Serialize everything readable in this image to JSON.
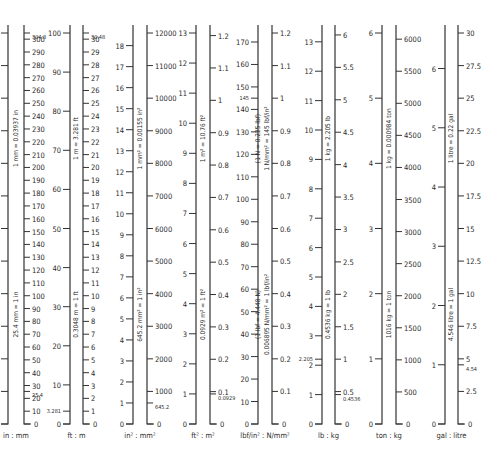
{
  "chart_data": {
    "type": "conversion-scales",
    "baseline_y": 424,
    "top_y": 33,
    "scales": [
      {
        "id": "in-mm",
        "caption": "in : mm",
        "left": {
          "unit": "in",
          "x": 8,
          "max": 12,
          "ticks": [
            0,
            1,
            2,
            3,
            4,
            5,
            6,
            7,
            8,
            9,
            10,
            11,
            12
          ],
          "labels_visible": false,
          "extra": []
        },
        "right": {
          "unit": "mm",
          "x": 24,
          "max": 304.8,
          "ticks": [
            0,
            10,
            20,
            30,
            40,
            50,
            60,
            70,
            80,
            90,
            100,
            110,
            120,
            130,
            140,
            150,
            160,
            170,
            180,
            190,
            200,
            210,
            220,
            230,
            240,
            250,
            260,
            270,
            280,
            290,
            300
          ],
          "extra": [
            {
              "v": 304.8,
              "label": "304.8"
            },
            {
              "v": 25.4,
              "label": "25.4"
            }
          ]
        },
        "annotations": [
          "1 mm = 0.03937 in",
          "25.4 mm = 1 in"
        ]
      },
      {
        "id": "ft-m",
        "caption": "ft : m",
        "left": {
          "unit": "ft",
          "x": 70,
          "max": 100,
          "ticks": [
            0,
            10,
            20,
            30,
            40,
            50,
            60,
            70,
            80,
            90,
            100
          ],
          "extra": [
            {
              "v": 3.281,
              "label": "3.281"
            }
          ]
        },
        "right": {
          "unit": "m",
          "x": 83,
          "max": 30.48,
          "ticks": [
            0,
            1,
            2,
            3,
            4,
            5,
            6,
            7,
            8,
            9,
            10,
            11,
            12,
            13,
            14,
            15,
            16,
            17,
            18,
            19,
            20,
            21,
            22,
            23,
            24,
            25,
            26,
            27,
            28,
            29,
            30
          ],
          "extra": [
            {
              "v": 30.48,
              "label": "30.48"
            }
          ]
        },
        "annotations": [
          "1 m = 3.281 ft",
          "0.3048 m = 1 ft"
        ]
      },
      {
        "id": "in2-mm2",
        "caption": "in² : mm²",
        "left": {
          "unit": "in²",
          "x": 133,
          "max": 18.6,
          "ticks": [
            0,
            1,
            2,
            3,
            4,
            5,
            6,
            7,
            8,
            9,
            10,
            11,
            12,
            13,
            14,
            15,
            16,
            17,
            18
          ],
          "extra": []
        },
        "right": {
          "unit": "mm²",
          "x": 147,
          "max": 12000,
          "ticks": [
            0,
            1000,
            2000,
            3000,
            4000,
            5000,
            6000,
            7000,
            8000,
            9000,
            10000,
            11000,
            12000
          ],
          "extra": [
            {
              "v": 645.2,
              "label": "645.2"
            }
          ]
        },
        "annotations": [
          "1 mm² = 0.00155 in²",
          "645.2 mm² = 1 in²"
        ]
      },
      {
        "id": "ft2-m2",
        "caption": "ft² : m²",
        "left": {
          "unit": "ft²",
          "x": 196,
          "max": 13.0,
          "ticks": [
            0,
            1,
            2,
            3,
            4,
            5,
            6,
            7,
            8,
            9,
            10,
            11,
            12,
            13
          ],
          "extra": []
        },
        "right": {
          "unit": "m²",
          "x": 210,
          "max": 1.208,
          "ticks": [
            0,
            0.1,
            0.2,
            0.3,
            0.4,
            0.5,
            0.6,
            0.7,
            0.8,
            0.9,
            1.0,
            1.1,
            1.2
          ],
          "extra": [
            {
              "v": 0.0929,
              "label": "0.0929"
            }
          ]
        },
        "annotations": [
          "1 m² = 10.76 ft²",
          "0.0929 m² = 1 ft²"
        ]
      },
      {
        "id": "lbf-in2-n-mm2",
        "caption": "lbf/in² : N/mm²",
        "left": {
          "unit": "lbf/in²",
          "x": 258,
          "max": 174,
          "ticks": [
            0,
            10,
            20,
            30,
            40,
            50,
            60,
            70,
            80,
            90,
            100,
            110,
            120,
            130,
            140,
            150,
            160,
            170
          ],
          "extra": [
            {
              "v": 145,
              "label": "145"
            }
          ]
        },
        "right": {
          "unit": "N/mm²",
          "x": 272,
          "max": 1.2,
          "ticks": [
            0,
            0.1,
            0.2,
            0.3,
            0.4,
            0.5,
            0.6,
            0.7,
            0.8,
            0.9,
            1.0,
            1.1,
            1.2
          ],
          "extra": []
        },
        "annotations": [
          "(1 N = 0.225 lbf)",
          "1 N/mm² = 145 lbf/in²",
          "(1 lbf = 4.448 N)",
          "0.006895 N/mm² = 1 lbf/in²"
        ]
      },
      {
        "id": "lb-kg",
        "caption": "lb : kg",
        "left": {
          "unit": "lb",
          "x": 322,
          "max": 13.3,
          "ticks": [
            0,
            1,
            2,
            3,
            4,
            5,
            6,
            7,
            8,
            9,
            10,
            11,
            12,
            13
          ],
          "extra": [
            {
              "v": 2.205,
              "label": "2.205"
            }
          ]
        },
        "right": {
          "unit": "kg",
          "x": 335,
          "max": 6.03,
          "ticks": [
            0,
            0.5,
            1.0,
            1.5,
            2.0,
            2.5,
            3.0,
            3.5,
            4.0,
            4.5,
            5.0,
            5.5,
            6.0
          ],
          "extra": [
            {
              "v": 0.4536,
              "label": "0.4536"
            }
          ]
        },
        "annotations": [
          "1 kg = 2.205 lb",
          "0.4536 kg = 1 lb"
        ]
      },
      {
        "id": "ton-kg",
        "caption": "ton : kg",
        "left": {
          "unit": "ton",
          "x": 382,
          "max": 6.0,
          "ticks": [
            0,
            1,
            2,
            3,
            4,
            5,
            6
          ],
          "extra": []
        },
        "right": {
          "unit": "kg",
          "x": 396,
          "max": 6096,
          "ticks": [
            0,
            500,
            1000,
            1500,
            2000,
            2500,
            3000,
            3500,
            4000,
            4500,
            5000,
            5500,
            6000
          ],
          "extra": []
        },
        "annotations": [
          "1 kg = 0.000984 ton",
          "1016 kg = 1 ton"
        ]
      },
      {
        "id": "gal-litre",
        "caption": "gal : litre",
        "left": {
          "unit": "gal",
          "x": 445,
          "max": 6.6,
          "ticks": [
            0,
            1,
            2,
            3,
            4,
            5,
            6
          ],
          "extra": []
        },
        "right": {
          "unit": "litre",
          "x": 458,
          "max": 30,
          "ticks": [
            0,
            2.5,
            5,
            7.5,
            10,
            12.5,
            15,
            17.5,
            20,
            22.5,
            25,
            27.5,
            30
          ],
          "extra": [
            {
              "v": 4.54,
              "label": "4.54"
            }
          ]
        },
        "annotations": [
          "1 litre = 0.22 gal",
          "4.546 litre = 1 gal"
        ]
      }
    ]
  },
  "captions": {
    "in_mm": "in : mm",
    "ft_m": "ft : m",
    "in2_mm2": "in² : mm²",
    "ft2_m2": "ft² : m²",
    "lbf_nmm2": "lbf/in² : N/mm²",
    "lb_kg": "lb : kg",
    "ton_kg": "ton : kg",
    "gal_litre": "gal : litre"
  }
}
